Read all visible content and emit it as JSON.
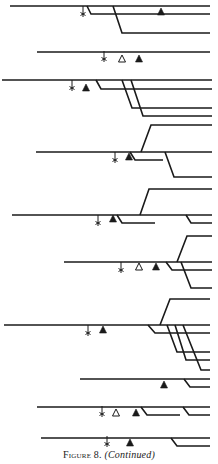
{
  "figure": {
    "caption_label": "Figure 8.",
    "caption_note": "(Continued)",
    "ink_color": "#1a1a1a",
    "marker_legend": {
      "star": "asterisk-marker",
      "open_triangle": "open-triangle-marker",
      "filled_triangle": "filled-triangle-marker"
    },
    "groups": [
      {
        "segments": [
          [
            [
              10,
              6
            ],
            [
              210,
              6
            ]
          ],
          [
            [
              87,
              6
            ],
            [
              91,
              14
            ],
            [
              210,
              14
            ]
          ],
          [
            [
              113,
              6
            ],
            [
              122,
              33
            ],
            [
              210,
              33
            ]
          ]
        ],
        "stars": [
          [
            83,
            14
          ]
        ],
        "open_triangles": [],
        "filled_triangles": [
          [
            161,
            12
          ]
        ]
      },
      {
        "segments": [
          [
            [
              37,
              52
            ],
            [
              210,
              52
            ]
          ]
        ],
        "stars": [
          [
            104,
            59
          ]
        ],
        "open_triangles": [
          [
            122,
            59
          ]
        ],
        "filled_triangles": [
          [
            139,
            59
          ]
        ]
      },
      {
        "segments": [
          [
            [
              2,
              80
            ],
            [
              212,
              80
            ]
          ],
          [
            [
              96,
              80
            ],
            [
              101,
              89
            ],
            [
              212,
              89
            ]
          ],
          [
            [
              122,
              80
            ],
            [
              132,
              108
            ],
            [
              212,
              108
            ]
          ],
          [
            [
              131,
              80
            ],
            [
              143,
              116
            ],
            [
              212,
              116
            ]
          ]
        ],
        "stars": [
          [
            72,
            88
          ]
        ],
        "open_triangles": [],
        "filled_triangles": [
          [
            86,
            88
          ]
        ]
      },
      {
        "segments": [
          [
            [
              36,
              152
            ],
            [
              212,
              152
            ]
          ],
          [
            [
              141,
              152
            ],
            [
              151,
              125
            ],
            [
              212,
              125
            ]
          ],
          [
            [
              130,
              152
            ],
            [
              135,
              160
            ],
            [
              163,
              160
            ]
          ],
          [
            [
              165,
              152
            ],
            [
              174,
              177
            ],
            [
              212,
              177
            ]
          ]
        ],
        "stars": [
          [
            115,
            160
          ]
        ],
        "open_triangles": [],
        "filled_triangles": [
          [
            129,
            157
          ]
        ]
      },
      {
        "segments": [
          [
            [
              12,
              215
            ],
            [
              212,
              215
            ]
          ],
          [
            [
              140,
              215
            ],
            [
              149,
              189
            ],
            [
              212,
              189
            ]
          ],
          [
            [
              117,
              215
            ],
            [
              122,
              223
            ],
            [
              155,
              223
            ]
          ],
          [
            [
              186,
              215
            ],
            [
              191,
              223
            ],
            [
              212,
              223
            ]
          ]
        ],
        "stars": [
          [
            98,
            223
          ]
        ],
        "open_triangles": [],
        "filled_triangles": [
          [
            113,
            219
          ]
        ]
      },
      {
        "segments": [
          [
            [
              64,
              262
            ],
            [
              212,
              262
            ]
          ],
          [
            [
              177,
              262
            ],
            [
              187,
              236
            ],
            [
              212,
              236
            ]
          ],
          [
            [
              166,
              262
            ],
            [
              172,
              270
            ],
            [
              212,
              270
            ]
          ],
          [
            [
              181,
              262
            ],
            [
              191,
              288
            ],
            [
              212,
              288
            ]
          ]
        ],
        "stars": [
          [
            121,
            270
          ]
        ],
        "open_triangles": [
          [
            139,
            267
          ]
        ],
        "filled_triangles": [
          [
            156,
            267
          ]
        ]
      },
      {
        "segments": [
          [
            [
              4,
              325
            ],
            [
              210,
              325
            ]
          ],
          [
            [
              160,
              325
            ],
            [
              170,
              299
            ],
            [
              210,
              299
            ]
          ],
          [
            [
              148,
              325
            ],
            [
              155,
              333
            ],
            [
              210,
              333
            ]
          ],
          [
            [
              167,
              325
            ],
            [
              177,
              352
            ],
            [
              210,
              352
            ]
          ],
          [
            [
              175,
              325
            ],
            [
              186,
              360
            ],
            [
              210,
              360
            ]
          ],
          [
            [
              183,
              325
            ],
            [
              201,
              370
            ],
            [
              210,
              370
            ]
          ]
        ],
        "stars": [
          [
            88,
            333
          ]
        ],
        "open_triangles": [],
        "filled_triangles": [
          [
            103,
            330
          ]
        ]
      },
      {
        "segments": [
          [
            [
              80,
              379
            ],
            [
              210,
              379
            ]
          ],
          [
            [
              184,
              379
            ],
            [
              190,
              387
            ],
            [
              210,
              387
            ]
          ]
        ],
        "stars": [],
        "open_triangles": [],
        "filled_triangles": [
          [
            164,
            385
          ]
        ]
      },
      {
        "segments": [
          [
            [
              37,
              407
            ],
            [
              210,
              407
            ]
          ],
          [
            [
              141,
              407
            ],
            [
              147,
              415
            ],
            [
              180,
              415
            ]
          ],
          [
            [
              183,
              407
            ],
            [
              189,
              415
            ],
            [
              210,
              415
            ]
          ]
        ],
        "stars": [
          [
            102,
            414
          ]
        ],
        "open_triangles": [
          [
            116,
            413
          ]
        ],
        "filled_triangles": [
          [
            136,
            413
          ]
        ]
      },
      {
        "segments": [
          [
            [
              41,
              438
            ],
            [
              210,
              438
            ]
          ],
          [
            [
              171,
              438
            ],
            [
              177,
              446
            ],
            [
              210,
              446
            ]
          ]
        ],
        "stars": [
          [
            107,
            444
          ]
        ],
        "open_triangles": [],
        "filled_triangles": [
          [
            130,
            443
          ]
        ]
      }
    ]
  }
}
